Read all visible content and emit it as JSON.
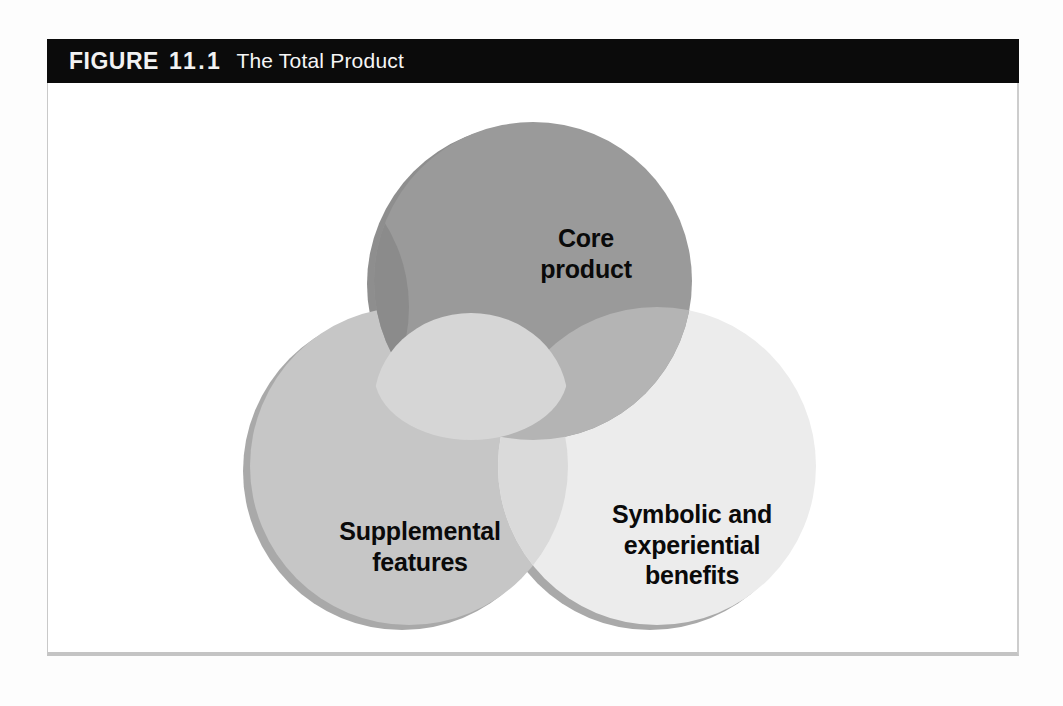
{
  "figure": {
    "label_word": "FIGURE",
    "number": "11.1",
    "title": "The Total Product"
  },
  "colors": {
    "caption_bar_bg": "#0b0b0b",
    "caption_text": "#f2f2f2",
    "frame_border": "#c9c9c9",
    "page_bg": "#ffffff",
    "core_circle": "#9a9a9a",
    "supplemental_circle": "#c6c6c6",
    "symbolic_circle": "#ececec",
    "overlap_core_supplemental": "#8b8b8b",
    "overlap_core_symbolic": "#b4b4b4",
    "overlap_supplemental_symbolic": "#dadada",
    "overlap_triple": "#d6d6d6",
    "shadow": "#8e8e8e",
    "label_text": "#0a0a0a"
  },
  "diagram": {
    "type": "venn-3-set",
    "sets": [
      {
        "id": "core",
        "label": "Core\nproduct",
        "position": "top",
        "fill": "#9a9a9a"
      },
      {
        "id": "supplemental",
        "label": "Supplemental\nfeatures",
        "position": "bottom-left",
        "fill": "#c6c6c6"
      },
      {
        "id": "symbolic",
        "label": "Symbolic and\nexperiential\nbenefits",
        "position": "bottom-right",
        "fill": "#ececec"
      }
    ]
  }
}
